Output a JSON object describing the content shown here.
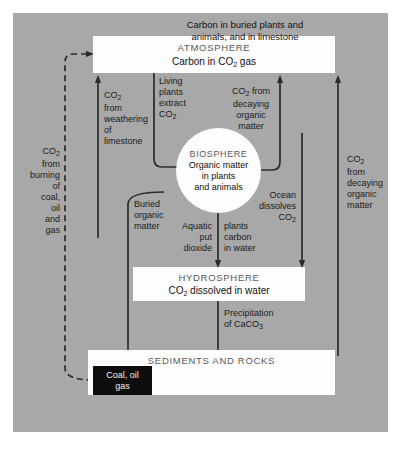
{
  "diagram": {
    "bg_color": "#a8a8a8",
    "box_color": "#fdfdfd",
    "ink_color": "#2b2b2b"
  },
  "boxes": {
    "atmosphere": {
      "header": "ATMOSPHERE",
      "body": "Carbon in CO2 gas"
    },
    "biosphere": {
      "header": "BIOSPHERE",
      "body_line1": "Organic matter",
      "body_line2": "in plants",
      "body_line3": "and animals"
    },
    "hydrosphere": {
      "header": "HYDROSPHERE",
      "body": "CO2 dissolved in water"
    },
    "sediments": {
      "header": "SEDIMENTS AND ROCKS",
      "body_line1": "Carbon in buried plants and",
      "body_line2": "animals, and in limestone"
    },
    "coal": {
      "line1": "Coal, oil",
      "line2": "gas"
    }
  },
  "labels": {
    "burning": {
      "l1": "CO2",
      "l2": "from",
      "l3": "burning",
      "l4": "of",
      "l5": "coal,",
      "l6": "oil",
      "l7": "and",
      "l8": "gas"
    },
    "weathering": {
      "l1": "CO2",
      "l2": "from",
      "l3": "weathering",
      "l4": "of",
      "l5": "limestone"
    },
    "living_plants": {
      "l1": "Living",
      "l2": "plants",
      "l3": "extract",
      "l4": "CO2"
    },
    "decaying_left": {
      "l1": "CO2 from",
      "l2": "decaying",
      "l3": "organic",
      "l4": "matter"
    },
    "decaying_right": {
      "l1": "CO2",
      "l2": "from",
      "l3": "decaying",
      "l4": "organic",
      "l5": "matter"
    },
    "buried": {
      "l1": "Buried",
      "l2": "organic",
      "l3": "matter"
    },
    "aquatic_left": {
      "l1": "Aquatic",
      "l2": "put",
      "l3": "dioxide"
    },
    "aquatic_right": {
      "l1": "plants",
      "l2": "carbon",
      "l3": "in water"
    },
    "ocean": {
      "l1": "Ocean",
      "l2": "dissolves",
      "l3": "CO2"
    },
    "precipitation": {
      "l1": "Precipitation",
      "l2": "of CaCO3"
    }
  }
}
